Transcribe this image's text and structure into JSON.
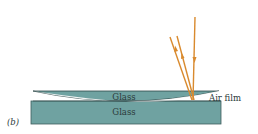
{
  "figure": {
    "panel_label": "(b)",
    "labels": {
      "top_glass": "Glass",
      "bottom_glass": "Glass",
      "air_film": "Air film"
    },
    "colors": {
      "glass_fill": "#6fa2a1",
      "glass_edge": "#3f5e5e",
      "ray": "#d98a2e",
      "text": "#2b3a3a"
    }
  }
}
